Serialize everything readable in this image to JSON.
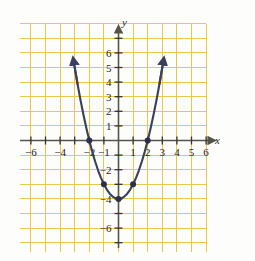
{
  "figure": {
    "title": "",
    "background_color": "#fdfdfb"
  },
  "chart_data": {
    "type": "line",
    "title": "",
    "subtitle": "",
    "xlabel": "x",
    "ylabel": "y",
    "xlim": [
      -7,
      7
    ],
    "ylim": [
      -7,
      7
    ],
    "grid": true,
    "grid_color": "#e8c84a",
    "grid_step": 1,
    "axis_color": "#56544a",
    "curve_color": "#3a3f5c",
    "point_color": "#2b2f4a",
    "legend": "none",
    "function": "y = x^2 - 4",
    "x_tick_labels": [
      "-6",
      "-4",
      "-2",
      "-1",
      "1",
      "2",
      "3",
      "4",
      "5",
      "6"
    ],
    "x_tick_values": [
      -6,
      -4,
      -2,
      -1,
      1,
      2,
      3,
      4,
      5,
      6
    ],
    "y_tick_labels": [
      "6",
      "5",
      "4",
      "3",
      "2",
      "1",
      "-2",
      "-4",
      "-6"
    ],
    "y_tick_values": [
      6,
      5,
      4,
      3,
      2,
      1,
      -2,
      -4,
      -6
    ],
    "series": [
      {
        "name": "y = x^2 - 4",
        "x": [
          -3.05,
          -2.8,
          -2.6,
          -2.4,
          -2.2,
          -2.0,
          -1.8,
          -1.6,
          -1.4,
          -1.2,
          -1.0,
          -0.8,
          -0.6,
          -0.4,
          -0.2,
          0.0,
          0.2,
          0.4,
          0.6,
          0.8,
          1.0,
          1.2,
          1.4,
          1.6,
          1.8,
          2.0,
          2.2,
          2.4,
          2.6,
          2.8,
          3.05
        ],
        "y": [
          5.3,
          3.84,
          2.76,
          1.76,
          0.84,
          0.0,
          -0.76,
          -1.44,
          -2.04,
          -2.56,
          -3.0,
          -3.36,
          -3.64,
          -3.84,
          -3.96,
          -4.0,
          -3.96,
          -3.84,
          -3.64,
          -3.36,
          -3.0,
          -2.56,
          -2.04,
          -1.44,
          -0.76,
          0.0,
          0.84,
          1.76,
          2.76,
          3.84,
          5.3
        ]
      }
    ],
    "marked_points": [
      {
        "x": -2,
        "y": 0,
        "label": "(-2, 0)"
      },
      {
        "x": -1,
        "y": -3,
        "label": "(-1, -3)"
      },
      {
        "x": 0,
        "y": -4,
        "label": "(0, -4)"
      },
      {
        "x": 1,
        "y": -3,
        "label": "(1, -3)"
      },
      {
        "x": 2,
        "y": 0,
        "label": "(2, 0)"
      }
    ],
    "curve_arrows": [
      "upper-left",
      "upper-right"
    ],
    "axis_arrows": [
      "x-positive",
      "y-positive"
    ]
  }
}
